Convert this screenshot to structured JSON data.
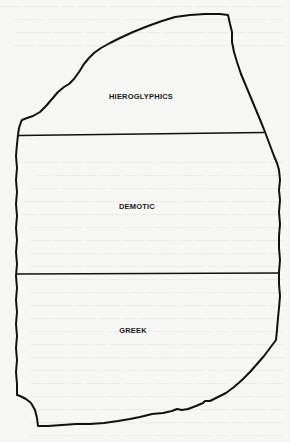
{
  "figure": {
    "type": "rosetta-stone-diagram",
    "sections": [
      {
        "id": "hieroglyphics",
        "label": "HIEROGLYPHICS",
        "label_x": 141,
        "label_y": 93
      },
      {
        "id": "demotic",
        "label": "DEMOTIC",
        "label_x": 137,
        "label_y": 202
      },
      {
        "id": "greek",
        "label": "GREEK",
        "label_x": 133,
        "label_y": 326
      }
    ],
    "dividers_y": [
      135,
      274
    ],
    "colors": {
      "outline": "#111111",
      "background": "#f7f7f5",
      "label": "#1a1a1a"
    }
  }
}
